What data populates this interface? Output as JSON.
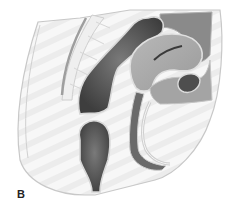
{
  "figure": {
    "panel_label": "B",
    "colors": {
      "background": "#ffffff",
      "tissue_light": "#f1f1f1",
      "outline": "#c8c8c8",
      "dark_organ": "#5a5a5a",
      "mid_organ": "#9a9a9a",
      "mid_organ_light": "#b4b4b4",
      "deep_gray": "#7e7e7e"
    }
  }
}
